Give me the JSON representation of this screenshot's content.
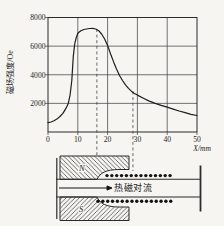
{
  "figure": {
    "background": "#f6f5f1",
    "line_color": "#2b2b2b"
  },
  "chart_data": {
    "type": "line",
    "title": "",
    "xlabel": "X/mm",
    "ylabel": "磁场强度/Oe",
    "xlim": [
      0,
      50
    ],
    "ylim": [
      0,
      8000
    ],
    "grid": true,
    "legend": false,
    "x_tick_labels": [
      "0",
      "10",
      "20",
      "30",
      "40",
      "50"
    ],
    "y_tick_labels": [
      "2000",
      "4000",
      "6000",
      "8000"
    ],
    "x_ticks": [
      0,
      10,
      20,
      30,
      40,
      50
    ],
    "y_ticks": [
      2000,
      4000,
      6000,
      8000
    ],
    "series": [
      {
        "name": "magnetic-field-strength-profile",
        "x": [
          0,
          1,
          2,
          3,
          4,
          5,
          6,
          6.8,
          7.4,
          8,
          8.5,
          9,
          9.5,
          10,
          11,
          12,
          13,
          14,
          15,
          16,
          17,
          18,
          19,
          20,
          21,
          22,
          23,
          24,
          25,
          26,
          27,
          28,
          29,
          30,
          32,
          34,
          36,
          38,
          40,
          42,
          44,
          46,
          48,
          50
        ],
        "y": [
          650,
          700,
          780,
          900,
          1080,
          1300,
          1650,
          2000,
          2600,
          3600,
          5300,
          6200,
          6600,
          6900,
          7080,
          7160,
          7200,
          7230,
          7240,
          7200,
          7080,
          6850,
          6500,
          6050,
          5450,
          4900,
          4400,
          3950,
          3600,
          3300,
          3050,
          2850,
          2700,
          2580,
          2360,
          2160,
          2000,
          1860,
          1740,
          1600,
          1470,
          1350,
          1240,
          1150
        ]
      }
    ],
    "annotations": {
      "peak_value_oe": 7240,
      "peak_x_mm": 15,
      "guide_lines_x_mm": [
        16.4,
        28.5
      ]
    }
  },
  "schematic": {
    "north_pole_label": "N",
    "south_pole_label": "S",
    "flow_label": "热磁对流",
    "heater_dot_rows": 2
  }
}
